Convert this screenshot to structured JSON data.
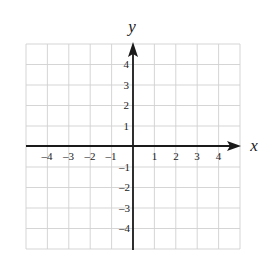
{
  "figure": {
    "type": "coordinate-plane",
    "x_axis": {
      "label": "x",
      "min": -5,
      "max": 5,
      "ticks": [
        -4,
        -3,
        -2,
        -1,
        1,
        2,
        3,
        4
      ]
    },
    "y_axis": {
      "label": "y",
      "min": -5,
      "max": 5,
      "ticks": [
        -4,
        -3,
        -2,
        -1,
        1,
        2,
        3,
        4
      ]
    },
    "grid": true,
    "colors": {
      "grid": "#d0d0d0",
      "axis": "#1a1a1a",
      "text": "#222222"
    }
  },
  "labels": {
    "x_axis_name": "x",
    "y_axis_name": "y",
    "x_ticks": [
      "–4",
      "–3",
      "–2",
      "–1",
      "1",
      "2",
      "3",
      "4"
    ],
    "y_ticks_pos": [
      "4",
      "3",
      "2",
      "1"
    ],
    "y_ticks_neg": [
      "–1",
      "–2",
      "–3",
      "–4"
    ]
  }
}
